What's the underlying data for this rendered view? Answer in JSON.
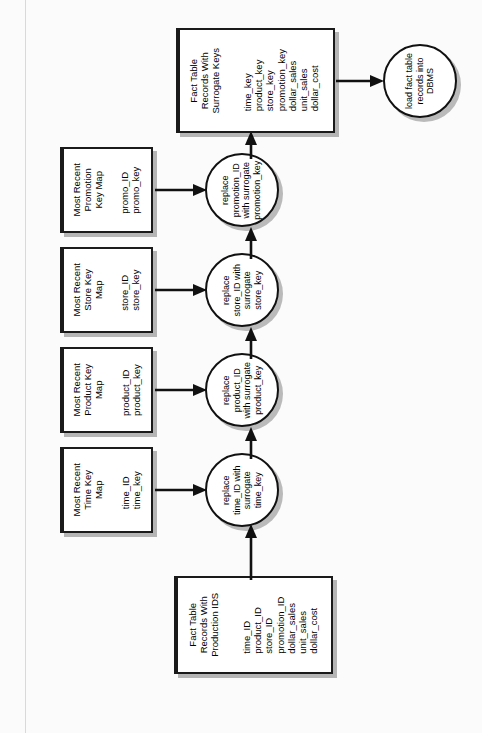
{
  "diagram": {
    "type": "data-flow-diagram",
    "orientation": "rotated-90-ccw",
    "colors": {
      "stroke": "#111111",
      "fill": "#ffffff",
      "shadow": "#00000045",
      "page_rule": "#d9d9d9"
    }
  },
  "source_entity": {
    "title": "Fact Table\nRecords With\nProduction IDS",
    "fields": "time_ID\nproduct_ID\nstore_ID\npromotion_ID\ndollar_sales\nunit_sales\ndollar_cost"
  },
  "target_entity": {
    "title": "Fact Table\nRecords With\nSurrogate Keys",
    "fields": "time_key\nproduct_key\nstore_key\npromotion_key\ndollar_sales\nunit_sales\ndollar_cost"
  },
  "lookup_maps": [
    {
      "title": "Most Recent\nTime Key\nMap",
      "fields": "time_ID\ntime_key"
    },
    {
      "title": "Most Recent\nProduct Key\nMap",
      "fields": "product_ID\nproduct_key"
    },
    {
      "title": "Most Recent\nStore Key\nMap",
      "fields": "store_ID\nstore_key"
    },
    {
      "title": "Most Recent\nPromotion\nKey Map",
      "fields": "promo_ID\npromo_key"
    }
  ],
  "processes": [
    {
      "label": "replace\ntime_ID with\nsurrogate\ntime_key"
    },
    {
      "label": "replace\nproduct_ID\nwith surrogate\nproduct_key"
    },
    {
      "label": "replace\nstore_ID with\nsurrogate\nstore_key"
    },
    {
      "label": "replace\npromotion_ID\nwith surrogate\npromotion_key"
    }
  ],
  "load_process": {
    "label": "load fact table\nrecords into\nDBMS"
  }
}
